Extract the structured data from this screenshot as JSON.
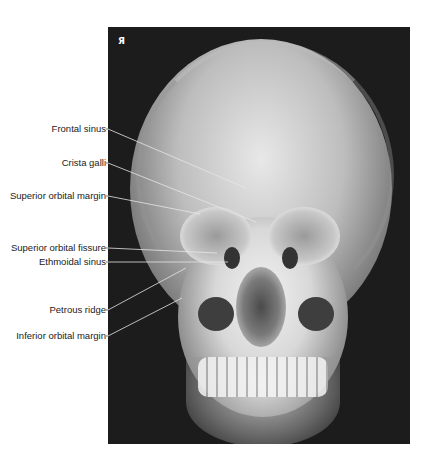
{
  "figure": {
    "type": "radiograph",
    "view": "PA skull",
    "side_marker": "Я"
  },
  "labels": [
    {
      "text": "Frontal sinus",
      "y": 129,
      "target": [
        246,
        188
      ]
    },
    {
      "text": "Crista galli",
      "y": 163,
      "target": [
        256,
        222
      ]
    },
    {
      "text": "Superior orbital margin",
      "y": 196,
      "target": [
        200,
        214
      ]
    },
    {
      "text": "Superior orbital fissure",
      "y": 248,
      "target": [
        217,
        253
      ]
    },
    {
      "text": "Ethmoidal sinus",
      "y": 262,
      "target": [
        228,
        262
      ]
    },
    {
      "text": "Petrous ridge",
      "y": 310,
      "target": [
        186,
        268
      ]
    },
    {
      "text": "Inferior orbital margin",
      "y": 336,
      "target": [
        182,
        298
      ]
    }
  ],
  "colors": {
    "leader_line": "#e6e6e6",
    "label_text": "#222222"
  }
}
